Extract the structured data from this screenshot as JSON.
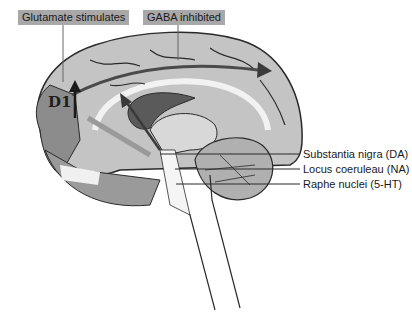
{
  "labels": {
    "top_left": "Glutamate stimulates",
    "top_right": "GABA inhibited",
    "receptor": "D1",
    "right": [
      "Substantia nigra (DA)",
      "Locus coeruleau (NA)",
      "Raphe nuclei (5-HT)"
    ]
  },
  "colors": {
    "tag_bg": "#a8a8a8",
    "cortex": "#c4c4c4",
    "dark": "#5a5a5a",
    "outline": "#2a2a2a"
  }
}
